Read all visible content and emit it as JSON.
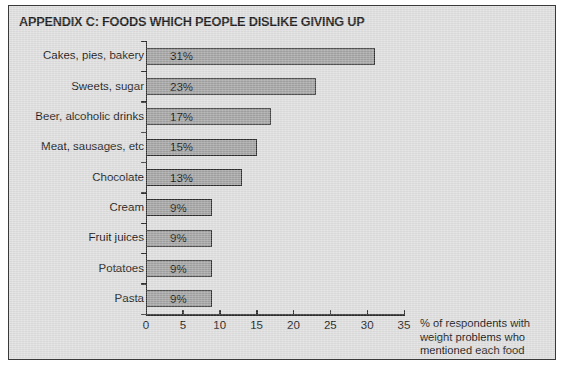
{
  "figure": {
    "title": "APPENDIX C: FOODS WHICH PEOPLE DISLIKE GIVING UP",
    "background_color": "#dedede",
    "border_color": "#3a3a3a",
    "bar_fill_color": "#a3a3a3",
    "bar_edge_color": "#2e2e2e",
    "text_color": "#141414"
  },
  "axis_note": {
    "line1": "% of respondents with",
    "line2": "weight problems who",
    "line3": "mentioned each food"
  },
  "chart_data": {
    "type": "bar",
    "orientation": "horizontal",
    "title": "APPENDIX C: FOODS WHICH PEOPLE DISLIKE GIVING UP",
    "xlabel": "% of respondents with weight problems who mentioned each food",
    "ylabel": "",
    "xlim": [
      0,
      35
    ],
    "xticks": [
      0,
      5,
      10,
      15,
      20,
      25,
      30,
      35
    ],
    "xtick_labels": [
      "0",
      "5",
      "10",
      "15",
      "20",
      "25",
      "30",
      "35"
    ],
    "grid": false,
    "legend": false,
    "data_labels": [
      "31%",
      "23%",
      "17%",
      "15%",
      "13%",
      "9%",
      "9%",
      "9%",
      "9%"
    ],
    "data_label_position": "inside-left",
    "categories": [
      "Cakes, pies, bakery",
      "Sweets, sugar",
      "Beer, alcoholic drinks",
      "Meat, sausages, etc",
      "Chocolate",
      "Cream",
      "Fruit juices",
      "Potatoes",
      "Pasta"
    ],
    "values": [
      31,
      23,
      17,
      15,
      13,
      9,
      9,
      9,
      9
    ]
  }
}
